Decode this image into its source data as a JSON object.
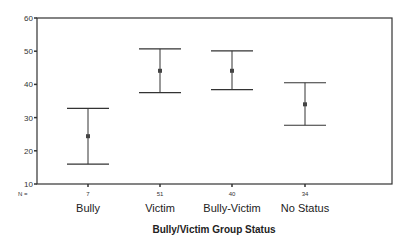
{
  "chart_data": {
    "type": "errorbar",
    "title": "",
    "xlabel": "Bully/Victim Group Status",
    "ylabel": "",
    "ylim": [
      10,
      60
    ],
    "yticks": [
      10,
      20,
      30,
      40,
      50,
      60
    ],
    "grid": false,
    "legend": null,
    "n_prefix": "N =",
    "categories": [
      "Bully",
      "Victim",
      "Bully-Victim",
      "No Status"
    ],
    "n": [
      "7",
      "51",
      "40",
      "34"
    ],
    "mean": [
      24.4,
      44.1,
      44.1,
      34.0
    ],
    "upper": [
      32.8,
      50.7,
      50.1,
      40.5
    ],
    "lower": [
      16.0,
      37.5,
      38.4,
      27.7
    ]
  },
  "colors": {
    "axis": "#333333",
    "bars": "#333333",
    "marker": "#444444"
  }
}
